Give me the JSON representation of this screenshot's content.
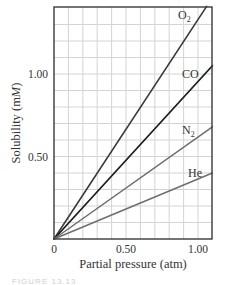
{
  "chart_data": {
    "type": "line",
    "title": "",
    "xlabel": "Partial pressure (atm)",
    "ylabel_main": "Solubility (m",
    "ylabel_italic": "M",
    "ylabel_end": ")",
    "ylabel": "Solubility (mM)",
    "xlim": [
      0,
      1.1
    ],
    "ylim": [
      0,
      1.41
    ],
    "grid": true,
    "legend_position": "inline-labels-right",
    "x_ticks": [
      {
        "value": 0,
        "label": "0"
      },
      {
        "value": 0.5,
        "label": "0.50"
      },
      {
        "value": 1.0,
        "label": "1.00"
      }
    ],
    "y_ticks": [
      {
        "value": 0.5,
        "label": "0.50"
      },
      {
        "value": 1.0,
        "label": "1.00"
      }
    ],
    "x_grid_step": 0.1,
    "y_grid_step": 0.1,
    "series": [
      {
        "name": "O2",
        "label_main": "O",
        "label_sub": "2",
        "slope": 1.33,
        "x": [
          0,
          1.06
        ],
        "values": [
          0,
          1.41
        ],
        "color": "#3a3a3a",
        "width": 1.6,
        "label_pos": [
          178,
          19
        ]
      },
      {
        "name": "CO",
        "label_main": "CO",
        "label_sub": "",
        "slope": 0.96,
        "x": [
          0,
          1.1
        ],
        "values": [
          0,
          1.05
        ],
        "color": "#1e1e1e",
        "width": 1.8,
        "label_pos": [
          182,
          78
        ]
      },
      {
        "name": "N2",
        "label_main": "N",
        "label_sub": "2",
        "slope": 0.62,
        "x": [
          0,
          1.1
        ],
        "values": [
          0,
          0.68
        ],
        "color": "#6e6e6e",
        "width": 1.5,
        "label_pos": [
          182,
          134
        ]
      },
      {
        "name": "He",
        "label_main": "He",
        "label_sub": "",
        "slope": 0.36,
        "x": [
          0,
          1.1
        ],
        "values": [
          0,
          0.4
        ],
        "color": "#6e6e6e",
        "width": 1.5,
        "label_pos": [
          188,
          177
        ]
      }
    ]
  },
  "caption": "FIGURE 13.13"
}
